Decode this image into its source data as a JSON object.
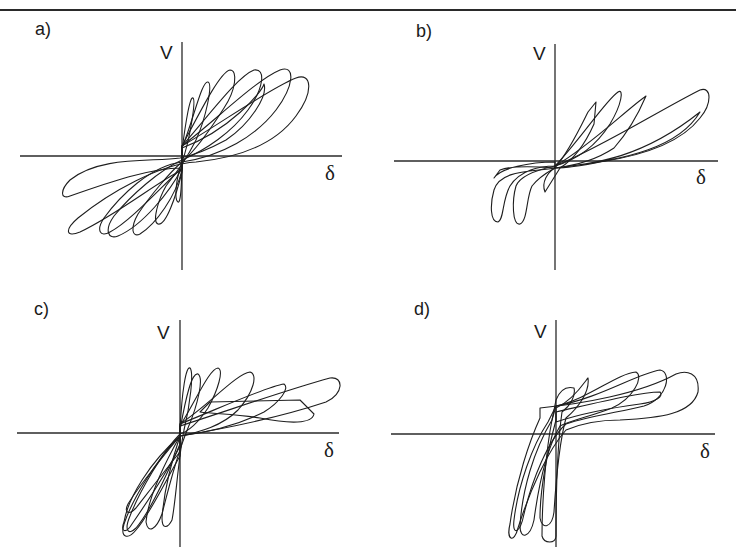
{
  "figure": {
    "panels": [
      {
        "id": "a",
        "label": "a)",
        "ylabel": "V",
        "xlabel": "δ"
      },
      {
        "id": "b",
        "label": "b)",
        "ylabel": "V",
        "xlabel": "δ"
      },
      {
        "id": "c",
        "label": "c)",
        "ylabel": "V",
        "xlabel": "δ"
      },
      {
        "id": "d",
        "label": "d)",
        "ylabel": "V",
        "xlabel": "δ"
      }
    ],
    "line_color": "#1e1e1e",
    "axis_color": "#2a2a2a"
  },
  "chart_data": [
    {
      "type": "line",
      "title": "a)",
      "xlabel": "δ",
      "ylabel": "V",
      "grid": false,
      "description": "Symmetric pinched hysteresis loops of shear force V vs displacement δ; cycles grow progressively in both directions",
      "axes": {
        "origin": [
          182,
          156
        ],
        "x_range_px": [
          20,
          342
        ],
        "y_range_px": [
          42,
          270
        ]
      },
      "series": [
        {
          "name": "cycle-1",
          "path": "M182,150 C186,120 190,96 193,98 C196,100 190,140 182,162 C176,178 174,200 178,202 C181,204 182,180 182,150 Z"
        },
        {
          "name": "cycle-2",
          "path": "M182,148 C194,118 202,80 208,82 C213,84 206,118 196,140 C186,160 178,170 166,186 C158,200 152,222 158,224 C166,226 176,196 182,172 Z"
        },
        {
          "name": "cycle-3",
          "path": "M182,146 C200,112 220,72 230,70 C238,70 236,90 224,108 C210,130 196,150 182,162 C170,172 150,196 138,214 C130,228 132,238 140,234 C156,224 176,196 182,170 Z"
        },
        {
          "name": "cycle-4",
          "path": "M182,146 C210,114 238,76 254,70 C266,68 264,88 248,110 C232,132 206,150 182,160 C160,170 132,194 114,216 C104,230 108,240 118,236 C142,226 170,192 182,168 Z"
        },
        {
          "name": "cycle-5",
          "path": "M182,146 C216,120 256,80 280,70 C296,64 294,86 276,110 C256,136 222,156 182,162 C150,166 120,196 104,218 C96,230 100,238 110,232 C130,222 164,184 182,168 Z"
        },
        {
          "name": "cycle-6",
          "path": "M182,146 C220,124 270,88 296,78 C312,72 314,92 296,116 C274,146 236,158 196,162 C160,164 110,192 78,218 C64,230 66,238 80,232 C118,214 160,180 182,170 Z"
        },
        {
          "name": "cycle-7",
          "path": "M182,148 C230,130 262,92 264,84 C268,96 250,124 226,140 C204,152 190,156 180,158 C150,162 100,156 70,180 C60,190 60,200 70,196 C110,182 150,168 182,168 Z"
        }
      ]
    },
    {
      "type": "line",
      "title": "b)",
      "xlabel": "δ",
      "ylabel": "V",
      "grid": false,
      "description": "Asymmetric pinched hysteresis loops; large positive excursion, limited negative excursion with sharp unloading",
      "axes": {
        "origin": [
          555,
          161
        ],
        "x_range_px": [
          394,
          718
        ],
        "y_range_px": [
          44,
          270
        ]
      },
      "series": [
        {
          "name": "cycle-1",
          "path": "M555,168 C570,150 582,124 588,112 L596,102 L594,124 C586,142 576,158 560,168 L545,192 C541,182 548,172 555,168 Z"
        },
        {
          "name": "cycle-2",
          "path": "M555,166 C580,140 606,100 618,92 C624,88 622,104 610,124 C596,146 576,160 555,166 C536,170 520,176 516,186 C512,200 512,226 520,224 C528,220 526,198 532,186 C540,176 548,172 555,168 Z"
        },
        {
          "name": "cycle-3",
          "path": "M555,166 C590,146 626,110 646,96 C640,110 630,130 614,148 C596,160 572,166 555,168 C530,172 500,170 494,190 C490,204 490,222 498,222 C504,220 502,200 510,186 C520,170 540,166 555,166 Z"
        },
        {
          "name": "cycle-4",
          "path": "M555,166 C600,148 660,110 700,90 C712,86 712,104 700,118 C680,144 640,156 600,162 C580,166 566,168 555,168 Z"
        },
        {
          "name": "cycle-5",
          "path": "M555,168 C590,164 640,160 700,112 C680,146 630,160 555,168 C530,166 510,166 500,170 L494,178 C500,168 530,162 555,162 Z"
        }
      ]
    },
    {
      "type": "line",
      "title": "c)",
      "xlabel": "δ",
      "ylabel": "V",
      "grid": false,
      "description": "Asymmetric hysteresis loops; large positive displacement cycles with flattened peaks, compact negative cycles with steep branches",
      "axes": {
        "origin": [
          180,
          433
        ],
        "x_range_px": [
          17,
          339
        ],
        "y_range_px": [
          320,
          547
        ]
      },
      "series": [
        {
          "name": "cycle-1",
          "path": "M180,430 C182,390 186,366 190,368 C194,372 190,406 184,430 C178,460 176,500 172,520 C168,528 162,530 162,518 C164,490 172,460 180,436 Z"
        },
        {
          "name": "cycle-2",
          "path": "M180,430 C186,396 192,372 198,374 C204,378 198,404 188,428 C178,452 168,490 162,514 C156,530 148,534 146,522 C148,500 162,468 180,436 Z"
        },
        {
          "name": "cycle-3",
          "path": "M180,426 C196,400 210,368 218,368 C224,370 218,390 208,408 C196,426 186,432 180,434 C164,450 140,490 130,516 C124,530 128,536 136,528 C150,512 168,472 180,444 Z"
        },
        {
          "name": "cycle-4",
          "path": "M180,424 C210,404 236,374 250,372 C258,374 254,392 238,410 C222,426 200,432 180,436 C156,460 132,500 124,524 C120,538 128,540 136,530 C150,514 166,480 180,456 Z"
        },
        {
          "name": "cycle-5",
          "path": "M180,424 C220,408 268,386 284,384 C290,388 280,402 264,412 C240,424 210,432 180,436 C150,462 128,498 124,522 C120,532 126,534 132,524 C150,498 168,470 180,446 Z"
        },
        {
          "name": "cycle-6",
          "path": "M210,402 L300,400 L314,414 C312,424 290,424 260,418 C236,414 216,414 200,412 Z"
        },
        {
          "name": "cycle-7",
          "path": "M180,426 C230,410 286,390 330,378 C344,376 344,394 326,402 C290,414 240,426 180,436 C160,460 140,484 128,504 C124,512 128,516 136,508 C150,490 170,464 180,452 Z"
        }
      ]
    },
    {
      "type": "line",
      "title": "d)",
      "xlabel": "δ",
      "ylabel": "V",
      "grid": false,
      "description": "Strongly asymmetric hysteresis loops; positive side plateaus with growing displacement, negative side shows steep near-vertical branches",
      "axes": {
        "origin": [
          556,
          434
        ],
        "x_range_px": [
          391,
          715
        ],
        "y_range_px": [
          320,
          547
        ]
      },
      "series": [
        {
          "name": "cycle-1",
          "path": "M556,400 C560,390 566,386 574,388 C576,396 570,406 562,412 C558,440 556,490 556,536 C556,544 544,544 542,536 C542,500 546,450 552,420 Z"
        },
        {
          "name": "cycle-2",
          "path": "M556,408 C574,400 586,380 588,378 C590,392 578,408 566,418 C560,440 556,480 554,512 C552,528 542,530 540,518 C540,490 548,450 556,420 Z"
        },
        {
          "name": "cycle-3",
          "path": "M556,406 C590,398 616,374 636,372 C644,376 634,398 612,408 C592,416 572,420 560,426 C546,450 538,490 534,520 C530,538 520,540 520,526 C522,490 534,450 552,420 Z"
        },
        {
          "name": "cycle-4",
          "path": "M556,406 C600,398 636,374 660,370 C672,372 668,398 644,406 C620,412 590,416 566,424 C548,440 532,480 524,514 C520,534 512,536 514,520 C518,486 532,446 548,422 Z"
        },
        {
          "name": "cycle-5",
          "path": "M540,408 C580,404 640,394 676,374 C686,370 700,372 698,392 C692,414 660,418 620,420 C600,420 580,424 566,430 C548,450 530,490 518,528 C514,544 506,540 510,524 C516,480 530,440 540,418 Z"
        },
        {
          "name": "cycle-6",
          "path": "M556,412 C600,402 640,392 660,392 C664,396 656,402 640,404 C610,408 580,414 556,422 Z"
        }
      ]
    }
  ]
}
